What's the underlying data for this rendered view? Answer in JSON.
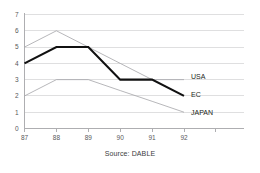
{
  "caption": "Source: DABLE",
  "chart_data": {
    "type": "line",
    "title": "",
    "subtitle": "",
    "xlabel": "",
    "ylabel": "",
    "categories": [
      "87",
      "88",
      "89",
      "90",
      "91",
      "92"
    ],
    "x": [
      87,
      88,
      89,
      90,
      91,
      92
    ],
    "ylim": [
      0,
      7
    ],
    "xlim": [
      87,
      92
    ],
    "yticks": [
      "0",
      "1",
      "2",
      "3",
      "4",
      "5",
      "6",
      "7"
    ],
    "grid": "horizontal",
    "legend_position": "line-end-labels",
    "series": [
      {
        "name": "USA",
        "values": [
          5,
          6,
          5,
          4,
          3,
          3
        ],
        "color": "#a5a5a8",
        "emphasis": "thin"
      },
      {
        "name": "EC",
        "values": [
          4,
          5,
          5,
          3,
          3,
          2
        ],
        "color": "#111111",
        "emphasis": "thick"
      },
      {
        "name": "JAPAN",
        "values": [
          2,
          3,
          3,
          2.33,
          1.67,
          1
        ],
        "color": "#a5a5a8",
        "emphasis": "thin"
      }
    ],
    "annotations": [
      {
        "text": "USA",
        "anchor_series": "USA",
        "anchor_x": 92
      },
      {
        "text": "EC",
        "anchor_series": "EC",
        "anchor_x": 92
      },
      {
        "text": "JAPAN",
        "anchor_series": "JAPAN",
        "anchor_x": 92
      }
    ]
  }
}
